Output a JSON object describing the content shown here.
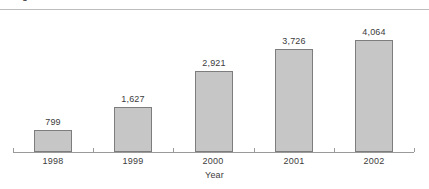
{
  "figure": {
    "caption": "Figure",
    "background_color": "#ffffff",
    "rule_color": "#bdbdbd"
  },
  "chart_data": {
    "type": "bar",
    "title": "",
    "subtitle": "",
    "categories": [
      "1998",
      "1999",
      "2000",
      "2001",
      "2002"
    ],
    "values": [
      799,
      1627,
      2921,
      3726,
      4064
    ],
    "value_labels": [
      "799",
      "1,627",
      "2,921",
      "3,726",
      "4,064"
    ],
    "xlabel": "Year",
    "ylabel": "",
    "ylim": [
      0,
      4064
    ],
    "grid": false,
    "legend": null,
    "axis_visible": {
      "x": true,
      "y": false
    },
    "colors": {
      "bar_fill": "#c6c6c6",
      "bar_border": "#7d7d7d",
      "axis": "#9a9a9a",
      "text": "#3c3c3c"
    }
  }
}
